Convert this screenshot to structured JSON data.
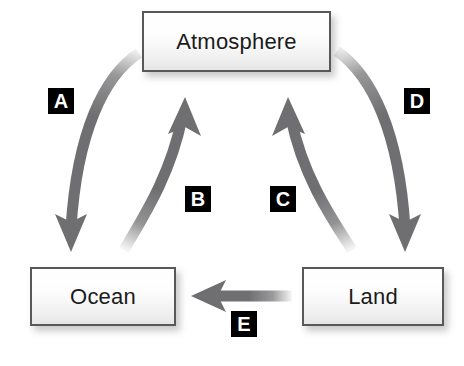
{
  "diagram": {
    "background_color": "#ffffff",
    "arrow_color": "#6f6f71",
    "box_border_color": "#58585a",
    "box_text_color": "#1b1b1b",
    "chip_background_color": "#000000",
    "chip_text_color": "#ffffff",
    "nodes": [
      {
        "id": "atmosphere",
        "label": "Atmosphere"
      },
      {
        "id": "ocean",
        "label": "Ocean"
      },
      {
        "id": "land",
        "label": "Land"
      }
    ],
    "arrows": [
      {
        "id": "a",
        "label": "A",
        "from": "atmosphere",
        "to": "ocean",
        "direction": "down-left",
        "shape": "curved"
      },
      {
        "id": "b",
        "label": "B",
        "from": "ocean",
        "to": "atmosphere",
        "direction": "up-right",
        "shape": "curved"
      },
      {
        "id": "c",
        "label": "C",
        "from": "land",
        "to": "atmosphere",
        "direction": "up-left",
        "shape": "curved"
      },
      {
        "id": "d",
        "label": "D",
        "from": "atmosphere",
        "to": "land",
        "direction": "down-right",
        "shape": "curved"
      },
      {
        "id": "e",
        "label": "E",
        "from": "land",
        "to": "ocean",
        "direction": "left",
        "shape": "straight"
      }
    ]
  }
}
